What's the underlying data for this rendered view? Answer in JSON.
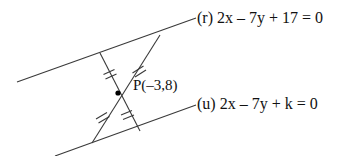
{
  "figure": {
    "stroke_color": "#3a3a3a",
    "point_color": "#000000",
    "background": "#ffffff",
    "line_r": {
      "label": "(r) 2x – 7y + 17 = 0",
      "equation": "2x - 7y + 17 = 0",
      "name": "r",
      "x1": 17,
      "y1": 82,
      "x2": 196,
      "y2": 18
    },
    "line_u": {
      "label": "(u) 2x – 7y + k = 0",
      "equation": "2x - 7y + k = 0",
      "name": "u",
      "x1": 55,
      "y1": 156,
      "x2": 196,
      "y2": 105
    },
    "point_p": {
      "label": "P(–3,8)",
      "x": -3,
      "y": 8,
      "px": 118,
      "py": 93
    },
    "transversal_1": {
      "x1": 100,
      "y1": 53,
      "x2": 140,
      "y2": 131
    },
    "transversal_2": {
      "x1": 160,
      "y1": 35,
      "x2": 92,
      "y2": 143
    },
    "tick_marks": {
      "count_per_segment": 2,
      "segments": [
        "upper-left",
        "upper-right",
        "lower-left",
        "lower-right"
      ]
    }
  }
}
